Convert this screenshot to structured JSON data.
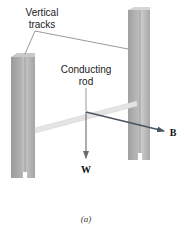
{
  "figure": {
    "caption": "(a)",
    "labels": {
      "vertical_tracks_line1": "Vertical",
      "vertical_tracks_line2": "tracks",
      "conducting_rod_line1": "Conducting",
      "conducting_rod_line2": "rod",
      "weight_vector": "W",
      "magnetic_field_vector": "B"
    },
    "colors": {
      "track_fill": "#a9a9a9",
      "track_light": "#c4c4c4",
      "track_dark": "#8e8e8e",
      "rod": "#e2e2e2",
      "rod_edge": "#cfcfcf",
      "b_arrow": "#4a5560",
      "w_arrow": "#6a6a6a",
      "leader_line": "#555555"
    }
  }
}
